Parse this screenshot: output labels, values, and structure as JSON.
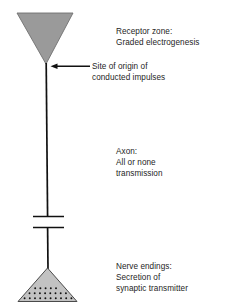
{
  "diagram": {
    "colors": {
      "receptor_zone_fill": "#9a9a9a",
      "receptor_zone_stroke": "#6f6f6f",
      "nerve_ending_fill": "#c2c2c2",
      "nerve_ending_stroke": "#4a4a4a",
      "axon_stroke": "#111111",
      "vesicle_dot": "#111111",
      "text": "#252525",
      "background": "#ffffff"
    },
    "labels": {
      "receptor_zone": {
        "line1": "Receptor zone:",
        "line2": "Graded electrogenesis"
      },
      "site_of_origin": {
        "line1": "Site of origin of",
        "line2": "conducted impulses"
      },
      "axon": {
        "line1": "Axon:",
        "line2": "All or none",
        "line3": "transmission"
      },
      "nerve_endings": {
        "line1": "Nerve endings:",
        "line2": "Secretion of",
        "line3": "synaptic transmitter"
      }
    },
    "shapes": {
      "receptor_zone_triangle": "inverted-triangle",
      "axon_line": "vertical-line",
      "axon_break_marks": "double-horizontal-bar",
      "nerve_ending_triangle": "upright-triangle",
      "synaptic_vesicles": "dot-cluster",
      "pointer": "left-arrow"
    },
    "vesicle_rows": [
      {
        "count": 5,
        "y": 288,
        "x_start": 35,
        "spacing": 5.2
      },
      {
        "count": 8,
        "y": 293,
        "x_start": 29,
        "spacing": 5.2
      },
      {
        "count": 10,
        "y": 298,
        "x_start": 24,
        "spacing": 5.2
      }
    ]
  }
}
